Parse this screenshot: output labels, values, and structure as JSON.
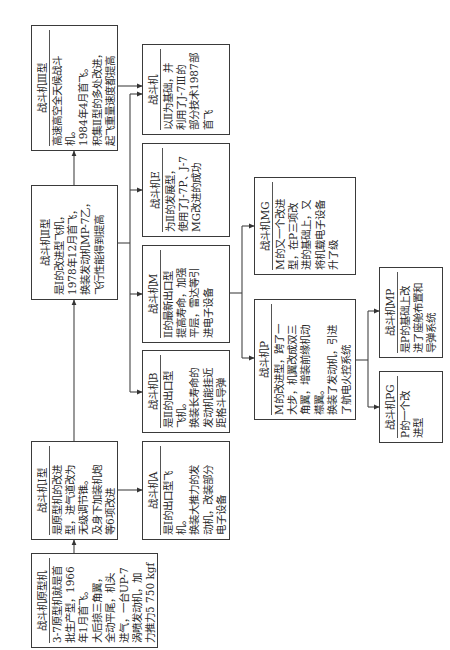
{
  "nodes": {
    "prototype": {
      "title": "战斗机原型机",
      "lines": [
        "3-7原型机就是首",
        "批生产型，1966",
        "年1月首飞。",
        "大后掠三角翼，",
        "全动平尾，机头",
        "进气，一台UP-7",
        "涡喷发动机，加",
        "力推力5 750 kgf"
      ]
    },
    "type1": {
      "title": "战斗机Ⅰ型",
      "lines": [
        "是原型机的改进",
        "型，进气道改为",
        "无级调节锥。",
        "及身下加装机炮",
        "等6项改进"
      ]
    },
    "type2": {
      "title": "战斗机Ⅱ型",
      "lines": [
        "是Ⅰ的改进型飞机，",
        "1978年12月首飞，",
        "换装发动机MP-7乙，",
        "飞行性能得到提高"
      ]
    },
    "type3": {
      "title": "战斗机Ⅲ型",
      "lines": [
        "高速高空全天候战斗",
        "机。",
        "1984年4月首飞。",
        "积集Ⅱ型的多处改进，",
        "起飞重量速度都提高"
      ]
    },
    "type2_base": {
      "title": "战斗机",
      "lines": [
        "以Ⅱ为基础，并",
        "利用了J-7Ⅲ的",
        "部分技术1987部",
        "首飞"
      ]
    },
    "e": {
      "title": "战斗机E",
      "lines": [
        "为Ⅱ的发展型，",
        "使用了J-7P、J-7",
        "MG改进的成功"
      ]
    },
    "m": {
      "title": "战斗机M",
      "lines": [
        "Ⅱ的最新出口型",
        "提高寿命，加强",
        "平层，雷达等引",
        "进电子设备"
      ]
    },
    "b": {
      "title": "战斗机B",
      "lines": [
        "是Ⅱ的出口型",
        "飞机。",
        "换装长寿命的",
        "发动机能挂近",
        "距格斗导弹"
      ]
    },
    "a": {
      "title": "战斗机A",
      "lines": [
        "是Ⅰ的出口型飞",
        "机。",
        "换装大推力的发",
        "动机，改装部分",
        "电子设备"
      ]
    },
    "mg": {
      "title": "战斗机MG",
      "lines": [
        "M的又一个改进",
        "型，在P三项改",
        "进的基础上，又",
        "将机载电子设备",
        "升了级"
      ]
    },
    "p": {
      "title": "战斗机P",
      "lines": [
        "M的改进型，跨了一",
        "大步，机翼改成双三",
        "角翼，增装前缘机动",
        "襟翼。",
        "换装了发动机，引进",
        "了航电火控系统"
      ]
    },
    "mp": {
      "title": "战斗机MP",
      "lines": [
        "是P的基础上改",
        "进了座舱布置和",
        "导弹系统"
      ]
    },
    "pg": {
      "title": "战斗机PG",
      "lines": [
        "P的一个改",
        "进型"
      ]
    }
  },
  "edges": [
    {
      "from": "prototype",
      "to": "type1"
    },
    {
      "from": "type1",
      "to": "type2"
    },
    {
      "from": "type2",
      "to": "type3"
    },
    {
      "from": "type1",
      "to": "a"
    },
    {
      "from": "type3",
      "to": "type2_base"
    },
    {
      "from": "type2",
      "to": "type2_base"
    },
    {
      "from": "type2",
      "to": "e"
    },
    {
      "from": "type2",
      "to": "m"
    },
    {
      "from": "type2",
      "to": "b"
    },
    {
      "from": "m",
      "to": "mg"
    },
    {
      "from": "m",
      "to": "p"
    },
    {
      "from": "p",
      "to": "mp"
    },
    {
      "from": "p",
      "to": "pg"
    }
  ],
  "colors": {
    "line": "#444444",
    "border": "#3a3a3a",
    "text": "#2a2a2a",
    "background": "#ffffff"
  }
}
